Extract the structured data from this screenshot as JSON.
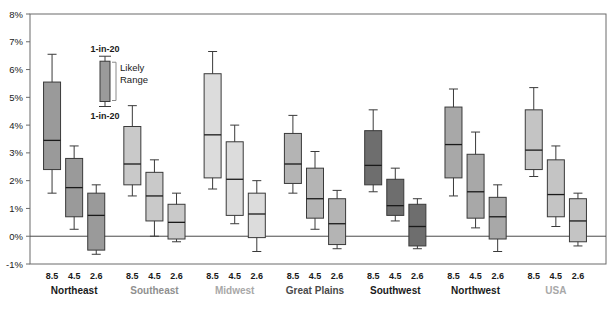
{
  "chart_data": {
    "type": "box",
    "title": "",
    "xlabel": "",
    "ylabel": "",
    "ylim": [
      -1,
      8
    ],
    "yticks": [
      "-1%",
      "0%",
      "1%",
      "2%",
      "3%",
      "4%",
      "5%",
      "6%",
      "7%",
      "8%"
    ],
    "ytick_values": [
      -1,
      0,
      1,
      2,
      3,
      4,
      5,
      6,
      7,
      8
    ],
    "grid": false,
    "zero_line": true,
    "scenario_labels": [
      "8.5",
      "4.5",
      "2.6"
    ],
    "legend": {
      "top_label": "1-in-20",
      "bottom_label": "1-in-20",
      "range_label_line1": "Likely",
      "range_label_line2": "Range"
    },
    "groups": [
      {
        "name": "Northeast",
        "color": "#9a9a9a",
        "label_color": "#1a1a1a",
        "boxes": [
          {
            "scenario": "8.5",
            "low": 1.55,
            "q1": 2.4,
            "median": 3.45,
            "q3": 5.55,
            "high": 6.55
          },
          {
            "scenario": "4.5",
            "low": 0.25,
            "q1": 0.7,
            "median": 1.75,
            "q3": 2.8,
            "high": 3.25
          },
          {
            "scenario": "2.6",
            "low": -0.65,
            "q1": -0.5,
            "median": 0.75,
            "q3": 1.55,
            "high": 1.85
          }
        ]
      },
      {
        "name": "Southeast",
        "color": "#c9c9c9",
        "label_color": "#8f8f8f",
        "boxes": [
          {
            "scenario": "8.5",
            "low": 1.45,
            "q1": 1.85,
            "median": 2.6,
            "q3": 3.95,
            "high": 4.7
          },
          {
            "scenario": "4.5",
            "low": 0.0,
            "q1": 0.55,
            "median": 1.45,
            "q3": 2.3,
            "high": 2.75
          },
          {
            "scenario": "2.6",
            "low": -0.2,
            "q1": -0.1,
            "median": 0.5,
            "q3": 1.15,
            "high": 1.55
          }
        ]
      },
      {
        "name": "Midwest",
        "color": "#dcdcdc",
        "label_color": "#a8a8a8",
        "boxes": [
          {
            "scenario": "8.5",
            "low": 1.7,
            "q1": 2.1,
            "median": 3.65,
            "q3": 5.85,
            "high": 6.65
          },
          {
            "scenario": "4.5",
            "low": 0.45,
            "q1": 0.75,
            "median": 2.05,
            "q3": 3.4,
            "high": 4.0
          },
          {
            "scenario": "2.6",
            "low": -0.55,
            "q1": -0.05,
            "median": 0.8,
            "q3": 1.55,
            "high": 2.0
          }
        ]
      },
      {
        "name": "Great Plains",
        "color": "#b4b4b4",
        "label_color": "#4a4a4a",
        "boxes": [
          {
            "scenario": "8.5",
            "low": 1.55,
            "q1": 1.9,
            "median": 2.6,
            "q3": 3.7,
            "high": 4.35
          },
          {
            "scenario": "4.5",
            "low": 0.25,
            "q1": 0.65,
            "median": 1.35,
            "q3": 2.45,
            "high": 3.05
          },
          {
            "scenario": "2.6",
            "low": -0.45,
            "q1": -0.3,
            "median": 0.45,
            "q3": 1.35,
            "high": 1.65
          }
        ]
      },
      {
        "name": "Southwest",
        "color": "#6e6e6e",
        "label_color": "#1a1a1a",
        "boxes": [
          {
            "scenario": "8.5",
            "low": 1.6,
            "q1": 1.85,
            "median": 2.55,
            "q3": 3.8,
            "high": 4.55
          },
          {
            "scenario": "4.5",
            "low": 0.55,
            "q1": 0.75,
            "median": 1.1,
            "q3": 2.05,
            "high": 2.45
          },
          {
            "scenario": "2.6",
            "low": -0.45,
            "q1": -0.35,
            "median": 0.35,
            "q3": 1.15,
            "high": 1.35
          }
        ]
      },
      {
        "name": "Northwest",
        "color": "#a8a8a8",
        "label_color": "#1a1a1a",
        "boxes": [
          {
            "scenario": "8.5",
            "low": 1.45,
            "q1": 2.1,
            "median": 3.3,
            "q3": 4.65,
            "high": 5.3
          },
          {
            "scenario": "4.5",
            "low": 0.3,
            "q1": 0.65,
            "median": 1.6,
            "q3": 2.95,
            "high": 3.75
          },
          {
            "scenario": "2.6",
            "low": -0.55,
            "q1": -0.1,
            "median": 0.7,
            "q3": 1.4,
            "high": 1.85
          }
        ]
      },
      {
        "name": "USA",
        "color": "#c4c4c4",
        "label_color": "#a8a8a8",
        "boxes": [
          {
            "scenario": "8.5",
            "low": 2.15,
            "q1": 2.4,
            "median": 3.1,
            "q3": 4.55,
            "high": 5.35
          },
          {
            "scenario": "4.5",
            "low": 0.35,
            "q1": 0.7,
            "median": 1.5,
            "q3": 2.75,
            "high": 3.25
          },
          {
            "scenario": "2.6",
            "low": -0.35,
            "q1": -0.2,
            "median": 0.55,
            "q3": 1.35,
            "high": 1.55
          }
        ]
      }
    ]
  }
}
